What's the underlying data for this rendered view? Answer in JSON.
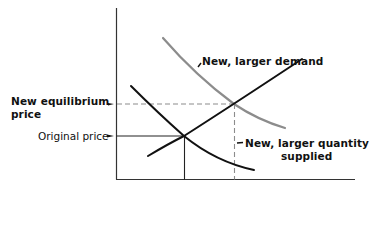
{
  "diagram": {
    "type": "supply-demand",
    "labels": {
      "new_demand": "New, larger demand",
      "new_equilibrium_line1": "New equilibrium",
      "new_equilibrium_line2": "price",
      "original_price": "Original price",
      "new_quantity_line1": "New, larger quantity",
      "new_quantity_line2": "supplied"
    },
    "colors": {
      "axis": "#333333",
      "supply": "#111111",
      "original_demand": "#111111",
      "new_demand": "#8c8c8c",
      "guide_solid": "#222222",
      "guide_dashed": "#8c8c8c",
      "text": "#111111"
    },
    "curves": {
      "supply": {
        "from": [
          148,
          156
        ],
        "to": [
          302,
          59
        ]
      },
      "original_demand": {
        "from": [
          131,
          86
        ],
        "through": [
          184,
          136
        ],
        "to": [
          254,
          170
        ]
      },
      "new_demand": {
        "from": [
          163,
          38
        ],
        "through": [
          234,
          104
        ],
        "to": [
          285,
          128
        ]
      }
    },
    "points": {
      "original_equilibrium": [
        184,
        136
      ],
      "new_equilibrium": [
        234,
        104
      ]
    }
  }
}
